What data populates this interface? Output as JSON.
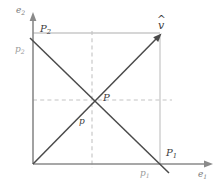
{
  "figure": {
    "type": "vector-decomposition-diagram",
    "colors": {
      "axis": "#8a8a8a",
      "line_dark": "#4a4a4a",
      "guide_grey": "#c9c9c9",
      "dashed_grey": "#c4c4c4",
      "label_dark": "#3b3b3b",
      "label_grey": "#9a9a9a",
      "background": "#ffffff"
    },
    "axes": {
      "x_label": "e",
      "x_label_sub": "1",
      "y_label": "e",
      "y_label_sub": "2",
      "origin": [
        33,
        164
      ],
      "x_end": [
        213,
        164
      ],
      "y_end": [
        33,
        12
      ]
    },
    "labels": {
      "vector_tip": {
        "text": "v",
        "accent": "^",
        "x": 160,
        "y": 33
      },
      "P_upper_left": {
        "text": "P",
        "sub": "2",
        "x": 42,
        "y": 32
      },
      "p_left": {
        "text": "p",
        "sub": "2",
        "x": 17,
        "y": 52
      },
      "P_center": {
        "text": "P",
        "x": 104,
        "y": 100
      },
      "p_center": {
        "text": "p",
        "x": 80,
        "y": 124
      },
      "P_lower_right": {
        "text": "P",
        "sub": "1",
        "x": 168,
        "y": 156
      },
      "p_lower_right": {
        "text": "p",
        "sub": "1",
        "x": 141,
        "y": 176
      }
    },
    "lines": {
      "ascending": {
        "from": [
          33,
          164
        ],
        "to": [
          161,
          34
        ]
      },
      "descending": {
        "from": [
          30,
          38
        ],
        "to": [
          169,
          173
        ]
      },
      "guide_top": {
        "from": [
          33,
          33
        ],
        "to": [
          160,
          33
        ]
      },
      "guide_right": {
        "from": [
          160,
          34
        ],
        "to": [
          160,
          164
        ]
      },
      "dash_horizontal": {
        "from": [
          33,
          100
        ],
        "to": [
          172,
          100
        ]
      },
      "dash_vertical": {
        "from": [
          92,
          31
        ],
        "to": [
          92,
          168
        ]
      }
    }
  }
}
